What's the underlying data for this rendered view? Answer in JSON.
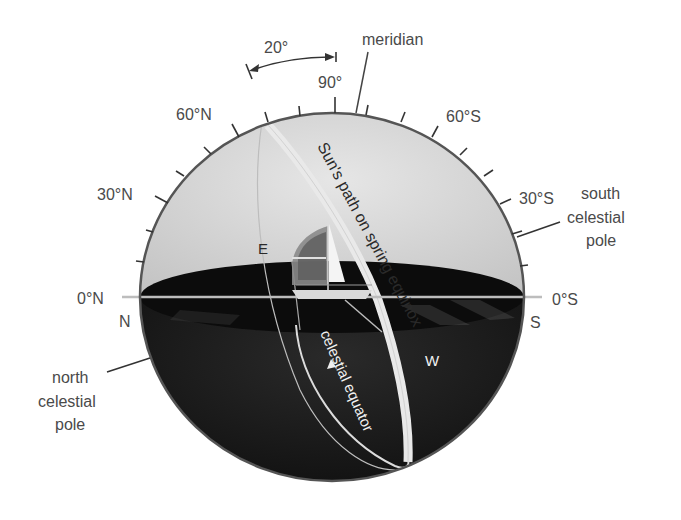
{
  "diagram": {
    "colors": {
      "upper_sky": "#d6d6d6",
      "lower_sphere": "#1a1a1a",
      "horizon_disc": "#0d0d0d",
      "outline": "#555555",
      "sun_path": "#e8e8e8",
      "label_text": "#4a4a4a"
    },
    "angle_annotation": {
      "label": "20°"
    },
    "top_labels": {
      "zenith": "90°",
      "meridian": "meridian"
    },
    "altitude_labels": {
      "n60": "60°N",
      "n30": "30°N",
      "n0": "0°N",
      "s60": "60°S",
      "s30": "30°S",
      "s0": "0°S"
    },
    "compass": {
      "north": "N",
      "south": "S",
      "east": "E",
      "west": "W"
    },
    "poles": {
      "south": [
        "south",
        "celestial",
        "pole"
      ],
      "north": [
        "north",
        "celestial",
        "pole"
      ]
    },
    "paths": {
      "sun_path": "Sun's path on spring equinox",
      "celestial_equator": "celestial equator"
    }
  }
}
